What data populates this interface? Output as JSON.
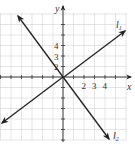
{
  "figure": {
    "type": "coordinate-plane-diagram",
    "axes": {
      "x_label": "x",
      "y_label": "y",
      "x_tick_labels": [
        "2",
        "3",
        "4"
      ],
      "y_tick_labels": [
        "2",
        "3",
        "4"
      ]
    },
    "lines": [
      {
        "name": "l1",
        "label_main": "l",
        "label_sub": "1",
        "through": [
          0,
          0
        ],
        "slope_approx": 0.75,
        "direction": "up-right"
      },
      {
        "name": "l2",
        "label_main": "l",
        "label_sub": "2",
        "through": [
          0,
          0
        ],
        "slope_approx": -1.33,
        "direction": "down-right"
      }
    ],
    "grid": true,
    "colors": {
      "grid": "#d4d4d4",
      "axis": "#333333",
      "line": "#222222"
    }
  }
}
